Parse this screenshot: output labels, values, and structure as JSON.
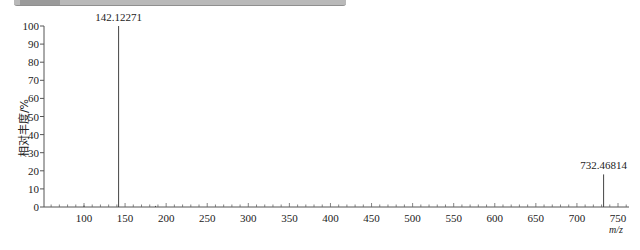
{
  "chart_data": {
    "type": "bar",
    "subtype": "mass-spectrum-stick",
    "title": "",
    "xlabel": "m/z",
    "ylabel": "相对丰度/%",
    "xlim": [
      51,
      763
    ],
    "ylim": [
      0,
      100
    ],
    "x_ticks": [
      100,
      150,
      200,
      250,
      300,
      350,
      400,
      450,
      500,
      550,
      600,
      650,
      700,
      750
    ],
    "y_ticks": [
      0,
      10,
      20,
      30,
      40,
      50,
      60,
      70,
      80,
      90,
      100
    ],
    "grid": false,
    "legend": null,
    "peaks": [
      {
        "mz": 100,
        "intensity": 0.8,
        "label": ""
      },
      {
        "mz": 142.12271,
        "intensity": 100,
        "label": "142.12271"
      },
      {
        "mz": 187,
        "intensity": 0.6,
        "label": ""
      },
      {
        "mz": 732.46814,
        "intensity": 18,
        "label": "732.46814"
      }
    ]
  },
  "labels": {
    "ylabel": "相对丰度/%",
    "xlabel": "m/z"
  }
}
